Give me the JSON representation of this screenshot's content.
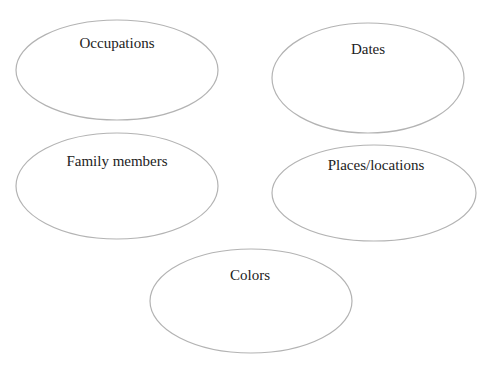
{
  "diagram": {
    "type": "graphic-organizer",
    "bubbles": [
      {
        "label": "Occupations",
        "cx": 117,
        "cy": 70,
        "rx": 101,
        "ry": 50,
        "text_y": 48
      },
      {
        "label": "Dates",
        "cx": 368,
        "cy": 78,
        "rx": 96,
        "ry": 55,
        "text_y": 54
      },
      {
        "label": "Family members",
        "cx": 117,
        "cy": 186,
        "rx": 101,
        "ry": 53,
        "text_y": 166
      },
      {
        "label": "Places/locations",
        "cx": 374,
        "cy": 193,
        "rx": 102,
        "ry": 48,
        "text_y": 170
      },
      {
        "label": "Colors",
        "cx": 251,
        "cy": 301,
        "rx": 101,
        "ry": 52,
        "text_y": 280
      }
    ],
    "stroke_color": "#b3b3b3",
    "text_color": "#222222"
  }
}
